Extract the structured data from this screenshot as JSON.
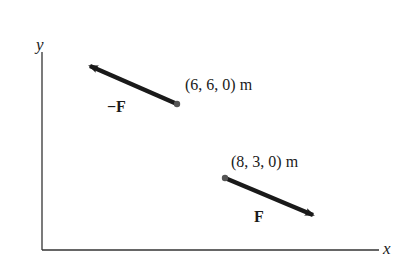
{
  "diagram": {
    "axes": {
      "x_label": "x",
      "y_label": "y"
    },
    "vectors": [
      {
        "name": "neg-force",
        "label": "−F",
        "point_label": "(6, 6, 0) m",
        "point": [
          6,
          6,
          0
        ],
        "direction": "up-left"
      },
      {
        "name": "force",
        "label": "F",
        "point_label": "(8, 3, 0) m",
        "point": [
          8,
          3,
          0
        ],
        "direction": "down-right"
      }
    ],
    "colors": {
      "ink": "#1a1a1a",
      "dot": "#555555",
      "axis": "#333333"
    }
  }
}
